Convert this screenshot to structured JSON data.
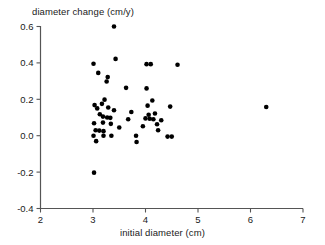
{
  "chart_data": {
    "type": "scatter",
    "title": "",
    "xlabel": "initial diameter (cm)",
    "ylabel": "diameter change (cm/y)",
    "xlim": [
      2,
      7
    ],
    "ylim": [
      -0.4,
      0.6
    ],
    "xticks": [
      2,
      3,
      4,
      5,
      6,
      7
    ],
    "xticklabels": [
      "2",
      "3",
      "4",
      "5",
      "6",
      "7"
    ],
    "yticks": [
      -0.4,
      -0.2,
      0.0,
      0.2,
      0.4,
      0.6
    ],
    "yticklabels": [
      "-0.4",
      "-0.2",
      "0.0",
      "0.2",
      "0.4",
      "0.6"
    ],
    "grid": false,
    "legend": false,
    "marker": "filled-circle",
    "marker_color": "#000000",
    "marker_size": 4.6,
    "n_points": 52,
    "points": [
      {
        "x": 3.4,
        "y": 0.6
      },
      {
        "x": 3.43,
        "y": 0.422
      },
      {
        "x": 3.01,
        "y": 0.395
      },
      {
        "x": 4.02,
        "y": 0.393
      },
      {
        "x": 4.1,
        "y": 0.393
      },
      {
        "x": 4.61,
        "y": 0.39
      },
      {
        "x": 3.1,
        "y": 0.345
      },
      {
        "x": 3.28,
        "y": 0.322
      },
      {
        "x": 3.26,
        "y": 0.298
      },
      {
        "x": 3.63,
        "y": 0.263
      },
      {
        "x": 4.02,
        "y": 0.26
      },
      {
        "x": 3.22,
        "y": 0.198
      },
      {
        "x": 4.13,
        "y": 0.193
      },
      {
        "x": 3.03,
        "y": 0.168
      },
      {
        "x": 3.17,
        "y": 0.175
      },
      {
        "x": 4.04,
        "y": 0.165
      },
      {
        "x": 4.47,
        "y": 0.16
      },
      {
        "x": 6.3,
        "y": 0.158
      },
      {
        "x": 3.08,
        "y": 0.15
      },
      {
        "x": 3.73,
        "y": 0.13
      },
      {
        "x": 4.18,
        "y": 0.122
      },
      {
        "x": 3.19,
        "y": 0.105
      },
      {
        "x": 3.27,
        "y": 0.1
      },
      {
        "x": 3.33,
        "y": 0.098
      },
      {
        "x": 4.0,
        "y": 0.095
      },
      {
        "x": 4.08,
        "y": 0.093
      },
      {
        "x": 3.67,
        "y": 0.09
      },
      {
        "x": 4.15,
        "y": 0.09
      },
      {
        "x": 3.02,
        "y": 0.068
      },
      {
        "x": 3.19,
        "y": 0.072
      },
      {
        "x": 3.34,
        "y": 0.065
      },
      {
        "x": 4.22,
        "y": 0.063
      },
      {
        "x": 4.24,
        "y": 0.03
      },
      {
        "x": 3.05,
        "y": 0.03
      },
      {
        "x": 3.12,
        "y": 0.028
      },
      {
        "x": 3.2,
        "y": 0.025
      },
      {
        "x": 3.01,
        "y": 0.0
      },
      {
        "x": 3.2,
        "y": 0.0
      },
      {
        "x": 3.35,
        "y": 0.0
      },
      {
        "x": 3.82,
        "y": 0.0
      },
      {
        "x": 4.42,
        "y": -0.005
      },
      {
        "x": 4.5,
        "y": -0.005
      },
      {
        "x": 3.06,
        "y": -0.03
      },
      {
        "x": 3.83,
        "y": -0.035
      },
      {
        "x": 3.02,
        "y": -0.203
      },
      {
        "x": 3.13,
        "y": 0.118
      },
      {
        "x": 3.4,
        "y": 0.14
      },
      {
        "x": 3.95,
        "y": 0.052
      },
      {
        "x": 4.3,
        "y": 0.085
      },
      {
        "x": 3.5,
        "y": 0.045
      },
      {
        "x": 3.29,
        "y": 0.155
      },
      {
        "x": 4.06,
        "y": 0.115
      }
    ]
  },
  "axes": {
    "x_title": "initial diameter (cm)",
    "y_title": "diameter change (cm/y)"
  }
}
